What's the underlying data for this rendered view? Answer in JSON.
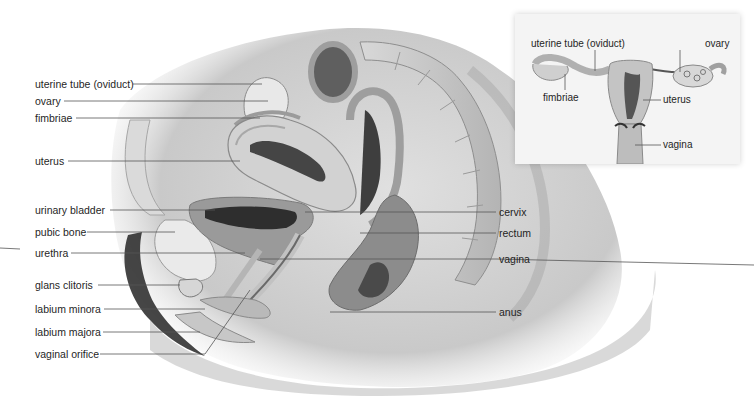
{
  "figure": {
    "main_view": "sagittal section of female pelvis",
    "inset_view": "frontal view of female reproductive organs"
  },
  "left_labels": [
    {
      "text": "uterine tube (oviduct)"
    },
    {
      "text": "ovary"
    },
    {
      "text": "fimbriae"
    },
    {
      "text": "uterus"
    },
    {
      "text": "urinary bladder"
    },
    {
      "text": "pubic bone"
    },
    {
      "text": "urethra"
    },
    {
      "text": "glans clitoris"
    },
    {
      "text": "labium minora"
    },
    {
      "text": "labium majora"
    },
    {
      "text": "vaginal orifice"
    }
  ],
  "right_labels": [
    {
      "text": "cervix"
    },
    {
      "text": "rectum"
    },
    {
      "text": "vagina"
    },
    {
      "text": "anus"
    }
  ],
  "inset_labels": {
    "uterine_tube": "uterine tube (oviduct)",
    "ovary": "ovary",
    "fimbriae": "fimbriae",
    "uterus": "uterus",
    "vagina": "vagina"
  },
  "colors": {
    "label_text": "#1f1f1f",
    "leader_line": "#555555",
    "tissue_light": "#e6e6e6",
    "tissue_mid": "#bdbdbd",
    "tissue_dark": "#6e6e6e"
  }
}
